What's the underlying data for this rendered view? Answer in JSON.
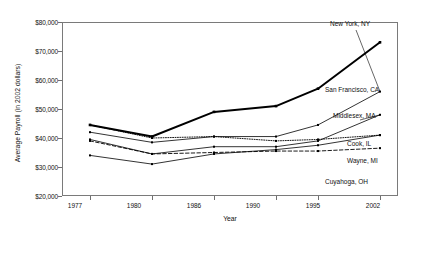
{
  "chart_data": {
    "type": "line",
    "title": "",
    "xlabel": "Year",
    "ylabel": "Average Payroll (in 2002 dollars)",
    "categories": [
      "1977",
      "1980",
      "1986",
      "1990",
      "1995",
      "2002"
    ],
    "ylim": [
      20000,
      80000
    ],
    "ytick_labels": [
      "$20,000",
      "$30,000",
      "$40,000",
      "$50,000",
      "$60,000",
      "$70,000",
      "$80,000"
    ],
    "ytick_values": [
      20000,
      30000,
      40000,
      50000,
      60000,
      70000,
      80000
    ],
    "grid": false,
    "legend_position": "inline-right-of-line-ends",
    "series": [
      {
        "name": "New York, NY",
        "style": "thick-solid",
        "values": [
          44500,
          40500,
          49000,
          51000,
          57000,
          73000
        ]
      },
      {
        "name": "San Francisco, CA",
        "style": "thin-solid",
        "values": [
          42000,
          38500,
          40500,
          40500,
          44500,
          56000
        ]
      },
      {
        "name": "Middlesex, MA",
        "style": "thin-solid",
        "values": [
          39500,
          34500,
          37000,
          37000,
          39000,
          48000
        ]
      },
      {
        "name": "Cook, IL",
        "style": "thin-solid",
        "values": [
          34000,
          31000,
          34500,
          36000,
          37500,
          41000
        ]
      },
      {
        "name": "Wayne, MI",
        "style": "dotted",
        "values": [
          44500,
          40000,
          40500,
          39000,
          39500,
          41000
        ]
      },
      {
        "name": "Cuyahoga, OH",
        "style": "dashed",
        "values": [
          39000,
          34500,
          35000,
          35500,
          35500,
          36500
        ]
      }
    ]
  },
  "axes": {
    "y_title": "Average Payroll (in 2002 dollars)",
    "x_title": "Year",
    "y_ticks": [
      "$80,000",
      "$70,000",
      "$60,000",
      "$50,000",
      "$40,000",
      "$30,000",
      "$20,000"
    ],
    "x_ticks": [
      "1977",
      "1980",
      "1986",
      "1990",
      "1995",
      "2002"
    ]
  },
  "labels": {
    "new_york": "New York, NY",
    "san_francisco": "San Francisco, CA",
    "middlesex": "Middlesex, MA",
    "cook": "Cook, IL",
    "wayne": "Wayne, MI",
    "cuyahoga": "Cuyahoga, OH"
  },
  "colors": {
    "line": "#000000",
    "frame": "#7a7a7a",
    "background": "#ffffff"
  }
}
